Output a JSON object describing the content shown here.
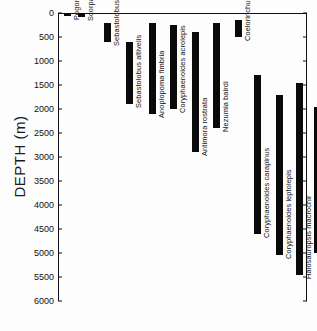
{
  "chart_data": {
    "type": "bar",
    "orientation": "vertical-range",
    "title": "",
    "xlabel": "",
    "ylabel": "DEPTH (m)",
    "ylim": [
      0,
      6000
    ],
    "y_inverted": true,
    "grid": false,
    "legend": "none",
    "ytick_labels": [
      "0",
      "500",
      "1000",
      "1500",
      "2000",
      "2500",
      "3000",
      "3500",
      "4000",
      "4500",
      "5000",
      "5500",
      "6000"
    ],
    "ytick_values": [
      0,
      500,
      1000,
      1500,
      2000,
      2500,
      3000,
      3500,
      4000,
      4500,
      5000,
      5500,
      6000
    ],
    "categories": [
      "Pogonoperca brachygramma",
      "Scorpaena guttata",
      "Sebastolobus alascanus",
      "Sebastolobus altivelis",
      "Anoplopoma fimbria",
      "Coryphaenoides acrolepis",
      "Antimora rostrata",
      "Nezumia bairdi",
      "Coelorinchus carminatus",
      "Coryphaenoides carapinus",
      "Coryphaenoides leptolepis",
      "Halosauropsis macrochir",
      "Coryphaenoides armatus",
      "Histiobranchus bathybius"
    ],
    "series": [
      {
        "name": "Depth range (m)",
        "ranges": [
          {
            "species": "Pogonoperca brachygramma",
            "min": 0,
            "max": 60
          },
          {
            "species": "Scorpaena guttata",
            "min": 0,
            "max": 80
          },
          {
            "species": "Sebastolobus alascanus",
            "min": 200,
            "max": 600
          },
          {
            "species": "Sebastolobus altivelis",
            "min": 600,
            "max": 1900
          },
          {
            "species": "Anoplopoma fimbria",
            "min": 200,
            "max": 2100
          },
          {
            "species": "Coryphaenoides acrolepis",
            "min": 250,
            "max": 2000
          },
          {
            "species": "Antimora rostrata",
            "min": 400,
            "max": 2900
          },
          {
            "species": "Nezumia bairdi",
            "min": 200,
            "max": 2400
          },
          {
            "species": "Coelorinchus carminatus",
            "min": 150,
            "max": 500
          },
          {
            "species": "Coryphaenoides carapinus",
            "min": 1300,
            "max": 4600
          },
          {
            "species": "Coryphaenoides leptolepis",
            "min": 1700,
            "max": 5050
          },
          {
            "species": "Halosauropsis macrochir",
            "min": 1450,
            "max": 5450
          },
          {
            "species": "Coryphaenoides armatus",
            "min": 1950,
            "max": 5000
          },
          {
            "species": "Histiobranchus bathybius",
            "min": 2400,
            "max": 4750
          }
        ]
      }
    ]
  },
  "axis": {
    "y_label": "DEPTH (m)"
  }
}
